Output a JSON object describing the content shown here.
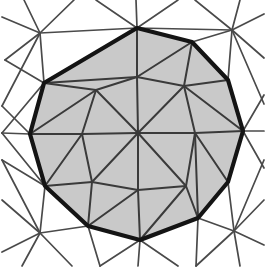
{
  "figure": {
    "width": 265,
    "height": 267
  },
  "colors": {
    "background": "#ffffff",
    "polygon_fill": "#c9c9c9",
    "boundary_stroke": "#141414",
    "interior_stroke": "#3a3a3a",
    "exterior_stroke": "#4a4a4a"
  },
  "chart_data": {
    "type": "scatter",
    "xlabel": "",
    "ylabel": "",
    "grid": false,
    "legend": "none",
    "xlim": [
      0,
      265
    ],
    "ylim": [
      0,
      267
    ],
    "boundary_polygon": [
      [
        137,
        28
      ],
      [
        192,
        42
      ],
      [
        228,
        80
      ],
      [
        243,
        131
      ],
      [
        228,
        182
      ],
      [
        198,
        218
      ],
      [
        140,
        240
      ],
      [
        88,
        226
      ],
      [
        45,
        186
      ],
      [
        30,
        134
      ],
      [
        44,
        83
      ]
    ],
    "interior_vertices": [
      [
        138,
        133
      ],
      [
        137,
        77
      ],
      [
        195,
        133
      ],
      [
        138,
        190
      ],
      [
        82,
        134
      ],
      [
        96,
        90
      ],
      [
        186,
        186
      ],
      [
        92,
        182
      ],
      [
        184,
        86
      ]
    ],
    "exterior_vertices": [
      [
        40,
        33
      ],
      [
        232,
        30
      ],
      [
        234,
        231
      ],
      [
        40,
        233
      ],
      [
        136,
        2
      ],
      [
        262,
        130
      ],
      [
        138,
        264
      ],
      [
        2,
        133
      ]
    ],
    "interior_edges": [
      [
        [
          138,
          133
        ],
        [
          137,
          77
        ]
      ],
      [
        [
          138,
          133
        ],
        [
          195,
          133
        ]
      ],
      [
        [
          138,
          133
        ],
        [
          138,
          190
        ]
      ],
      [
        [
          138,
          133
        ],
        [
          82,
          134
        ]
      ],
      [
        [
          138,
          133
        ],
        [
          96,
          90
        ]
      ],
      [
        [
          138,
          133
        ],
        [
          186,
          186
        ]
      ],
      [
        [
          138,
          133
        ],
        [
          92,
          182
        ]
      ],
      [
        [
          138,
          133
        ],
        [
          184,
          86
        ]
      ],
      [
        [
          137,
          77
        ],
        [
          96,
          90
        ]
      ],
      [
        [
          137,
          77
        ],
        [
          184,
          86
        ]
      ],
      [
        [
          137,
          77
        ],
        [
          137,
          28
        ]
      ],
      [
        [
          137,
          77
        ],
        [
          192,
          42
        ]
      ],
      [
        [
          137,
          77
        ],
        [
          44,
          83
        ]
      ],
      [
        [
          96,
          90
        ],
        [
          44,
          83
        ]
      ],
      [
        [
          96,
          90
        ],
        [
          82,
          134
        ]
      ],
      [
        [
          96,
          90
        ],
        [
          30,
          134
        ]
      ],
      [
        [
          82,
          134
        ],
        [
          30,
          134
        ]
      ],
      [
        [
          82,
          134
        ],
        [
          92,
          182
        ]
      ],
      [
        [
          82,
          134
        ],
        [
          45,
          186
        ]
      ],
      [
        [
          92,
          182
        ],
        [
          45,
          186
        ]
      ],
      [
        [
          92,
          182
        ],
        [
          88,
          226
        ]
      ],
      [
        [
          92,
          182
        ],
        [
          138,
          190
        ]
      ],
      [
        [
          138,
          190
        ],
        [
          88,
          226
        ]
      ],
      [
        [
          138,
          190
        ],
        [
          140,
          240
        ]
      ],
      [
        [
          138,
          190
        ],
        [
          186,
          186
        ]
      ],
      [
        [
          186,
          186
        ],
        [
          140,
          240
        ]
      ],
      [
        [
          186,
          186
        ],
        [
          198,
          218
        ]
      ],
      [
        [
          186,
          186
        ],
        [
          195,
          133
        ]
      ],
      [
        [
          195,
          133
        ],
        [
          198,
          218
        ]
      ],
      [
        [
          195,
          133
        ],
        [
          228,
          182
        ]
      ],
      [
        [
          195,
          133
        ],
        [
          243,
          131
        ]
      ],
      [
        [
          195,
          133
        ],
        [
          184,
          86
        ]
      ],
      [
        [
          184,
          86
        ],
        [
          243,
          131
        ]
      ],
      [
        [
          184,
          86
        ],
        [
          228,
          80
        ]
      ],
      [
        [
          184,
          86
        ],
        [
          192,
          42
        ]
      ],
      [
        [
          192,
          42
        ],
        [
          228,
          80
        ]
      ],
      [
        [
          30,
          134
        ],
        [
          45,
          186
        ]
      ],
      [
        [
          44,
          83
        ],
        [
          30,
          134
        ]
      ]
    ],
    "exterior_edges": [
      [
        [
          40,
          33
        ],
        [
          137,
          28
        ]
      ],
      [
        [
          40,
          33
        ],
        [
          44,
          83
        ]
      ],
      [
        [
          40,
          33
        ],
        [
          5,
          60
        ]
      ],
      [
        [
          40,
          33
        ],
        [
          2,
          17
        ]
      ],
      [
        [
          40,
          33
        ],
        [
          24,
          0
        ]
      ],
      [
        [
          40,
          33
        ],
        [
          74,
          0
        ]
      ],
      [
        [
          40,
          33
        ],
        [
          2,
          106
        ]
      ],
      [
        [
          137,
          28
        ],
        [
          136,
          0
        ]
      ],
      [
        [
          137,
          28
        ],
        [
          96,
          0
        ]
      ],
      [
        [
          137,
          28
        ],
        [
          178,
          0
        ]
      ],
      [
        [
          232,
          30
        ],
        [
          137,
          28
        ]
      ],
      [
        [
          232,
          30
        ],
        [
          228,
          80
        ]
      ],
      [
        [
          232,
          30
        ],
        [
          192,
          42
        ]
      ],
      [
        [
          232,
          30
        ],
        [
          195,
          0
        ]
      ],
      [
        [
          232,
          30
        ],
        [
          240,
          0
        ]
      ],
      [
        [
          232,
          30
        ],
        [
          264,
          14
        ]
      ],
      [
        [
          232,
          30
        ],
        [
          264,
          58
        ]
      ],
      [
        [
          232,
          30
        ],
        [
          264,
          104
        ]
      ],
      [
        [
          243,
          131
        ],
        [
          264,
          131
        ]
      ],
      [
        [
          243,
          131
        ],
        [
          264,
          95
        ]
      ],
      [
        [
          243,
          131
        ],
        [
          264,
          168
        ]
      ],
      [
        [
          234,
          231
        ],
        [
          198,
          218
        ]
      ],
      [
        [
          234,
          231
        ],
        [
          228,
          182
        ]
      ],
      [
        [
          234,
          231
        ],
        [
          264,
          200
        ]
      ],
      [
        [
          234,
          231
        ],
        [
          264,
          245
        ]
      ],
      [
        [
          234,
          231
        ],
        [
          240,
          266
        ]
      ],
      [
        [
          234,
          231
        ],
        [
          196,
          266
        ]
      ],
      [
        [
          234,
          231
        ],
        [
          264,
          160
        ]
      ],
      [
        [
          198,
          218
        ],
        [
          196,
          266
        ]
      ],
      [
        [
          140,
          240
        ],
        [
          138,
          266
        ]
      ],
      [
        [
          140,
          240
        ],
        [
          178,
          266
        ]
      ],
      [
        [
          140,
          240
        ],
        [
          100,
          266
        ]
      ],
      [
        [
          40,
          233
        ],
        [
          88,
          226
        ]
      ],
      [
        [
          40,
          233
        ],
        [
          45,
          186
        ]
      ],
      [
        [
          40,
          233
        ],
        [
          2,
          200
        ]
      ],
      [
        [
          40,
          233
        ],
        [
          2,
          252
        ]
      ],
      [
        [
          40,
          233
        ],
        [
          22,
          266
        ]
      ],
      [
        [
          40,
          233
        ],
        [
          72,
          266
        ]
      ],
      [
        [
          40,
          233
        ],
        [
          2,
          160
        ]
      ],
      [
        [
          88,
          226
        ],
        [
          100,
          266
        ]
      ],
      [
        [
          2,
          133
        ],
        [
          30,
          134
        ]
      ],
      [
        [
          2,
          133
        ],
        [
          44,
          83
        ]
      ],
      [
        [
          2,
          133
        ],
        [
          45,
          186
        ]
      ],
      [
        [
          5,
          60
        ],
        [
          44,
          83
        ]
      ],
      [
        [
          2,
          106
        ],
        [
          30,
          134
        ]
      ],
      [
        [
          2,
          160
        ],
        [
          45,
          186
        ]
      ]
    ]
  }
}
